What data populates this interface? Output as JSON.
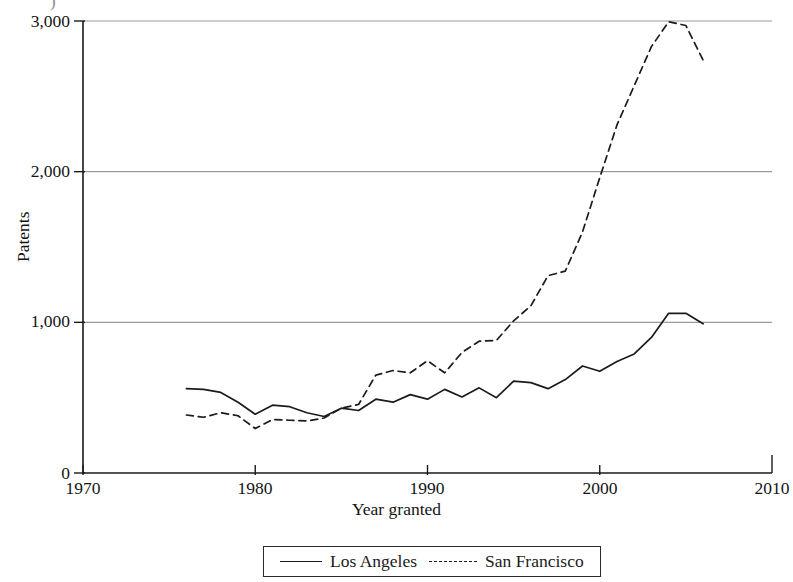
{
  "figure": {
    "cut_top_artifact": ")",
    "background_color": "#ffffff",
    "ink_color": "#1a1a1a",
    "grid_color": "#9a9a9a"
  },
  "axes": {
    "y_label": "Patents",
    "x_label": "Year granted",
    "y_ticks": [
      "0",
      "1,000",
      "2,000",
      "3,000"
    ],
    "x_ticks": [
      "1970",
      "1980",
      "1990",
      "2000",
      "2010"
    ]
  },
  "legend": {
    "entries": [
      {
        "label": "Los Angeles",
        "style": "solid"
      },
      {
        "label": "San Francisco",
        "style": "dashed"
      }
    ]
  },
  "chart_data": {
    "type": "line",
    "title": "",
    "xlabel": "Year granted",
    "ylabel": "Patents",
    "xlim": [
      1970,
      2010
    ],
    "ylim": [
      0,
      3000
    ],
    "xticks": [
      1970,
      1980,
      1990,
      2000,
      2010
    ],
    "yticks": [
      0,
      1000,
      2000,
      3000
    ],
    "grid": "horizontal",
    "legend_position": "below-axis-center",
    "x": [
      1976,
      1977,
      1978,
      1979,
      1980,
      1981,
      1982,
      1983,
      1984,
      1985,
      1986,
      1987,
      1988,
      1989,
      1990,
      1991,
      1992,
      1993,
      1994,
      1995,
      1996,
      1997,
      1998,
      1999,
      2000,
      2001,
      2002,
      2003,
      2004,
      2005,
      2006
    ],
    "series": [
      {
        "name": "Los Angeles",
        "style": "solid",
        "color": "#1b1b1b",
        "values": [
          560,
          555,
          535,
          470,
          390,
          450,
          440,
          400,
          375,
          430,
          415,
          490,
          470,
          520,
          490,
          555,
          505,
          565,
          500,
          610,
          600,
          560,
          620,
          710,
          675,
          740,
          790,
          900,
          1060,
          1060,
          990
        ]
      },
      {
        "name": "San Francisco",
        "style": "dashed",
        "color": "#1b1b1b",
        "values": [
          385,
          370,
          400,
          380,
          295,
          355,
          350,
          345,
          365,
          430,
          455,
          650,
          680,
          665,
          745,
          665,
          800,
          875,
          880,
          1010,
          1110,
          1310,
          1340,
          1600,
          1960,
          2310,
          2570,
          2830,
          2995,
          2970,
          2740
        ]
      }
    ]
  }
}
